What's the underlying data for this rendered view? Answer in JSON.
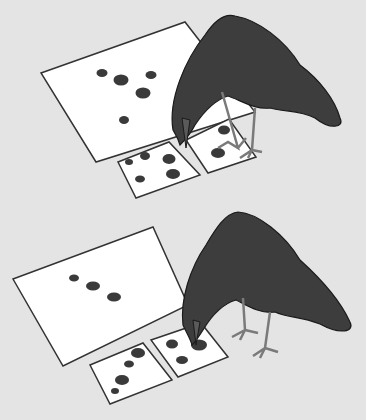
{
  "illustration": {
    "description": "Two panels each showing a crow selecting between two small cards of dots to match a large sample card",
    "colors": {
      "background": "#e4e4e4",
      "card": "#ffffff",
      "card_border": "#333333",
      "dot": "#3a3a3a",
      "crow_body": "#3d3d3d",
      "crow_outline": "#1a1a1a",
      "leg": "#7a7a7a"
    },
    "panels": [
      {
        "name": "top-panel",
        "sample_card_dots": 5,
        "choice_left_dots": 5,
        "choice_right_dots": 2
      },
      {
        "name": "bottom-panel",
        "sample_card_dots": 3,
        "choice_left_dots": 4,
        "choice_right_dots": 3
      }
    ]
  }
}
